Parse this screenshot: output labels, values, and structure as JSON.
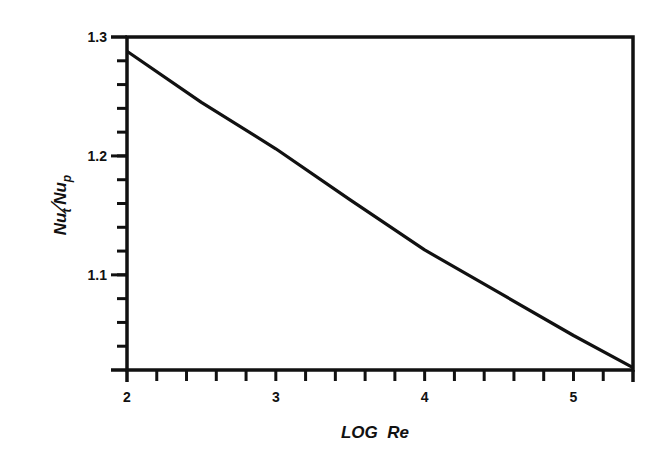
{
  "chart_data": {
    "type": "line",
    "title": "",
    "xlabel": "LOG  Re",
    "ylabel": "Nu_t / Nu_p",
    "ylabel_parts": {
      "num": "Nu",
      "num_sub": "t",
      "den": "Nu",
      "den_sub": "p"
    },
    "xlim": [
      2,
      5.4
    ],
    "ylim": [
      1.02,
      1.3
    ],
    "x_tick_labels": [
      "2",
      "3",
      "4",
      "5"
    ],
    "x_ticks": [
      2,
      3,
      4,
      5
    ],
    "x_minor_step": 0.2,
    "y_tick_labels": [
      "1.3",
      "1.2",
      "1.1"
    ],
    "y_ticks": [
      1.3,
      1.2,
      1.1
    ],
    "y_minor_step": 0.02,
    "grid": false,
    "legend": null,
    "series": [
      {
        "name": "Nu_t/Nu_p",
        "x": [
          2.0,
          2.5,
          3.0,
          3.5,
          4.0,
          4.5,
          5.0,
          5.4
        ],
        "y": [
          1.288,
          1.245,
          1.206,
          1.163,
          1.121,
          1.085,
          1.049,
          1.022
        ]
      }
    ]
  }
}
